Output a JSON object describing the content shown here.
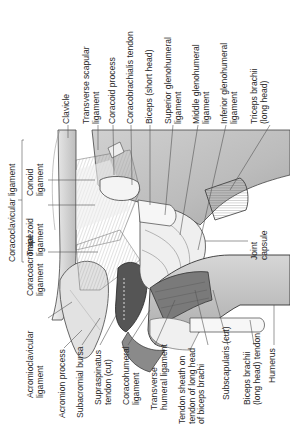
{
  "figure": {
    "orientation": "rotated 90° counter-clockwise"
  },
  "labels_top": [
    {
      "id": "clavicle",
      "lines": [
        "Clavicle"
      ]
    },
    {
      "id": "transverse-scapular-ligament",
      "lines": [
        "Transverse scapular",
        "ligament"
      ]
    },
    {
      "id": "coracoid-process",
      "lines": [
        "Coracoid process"
      ]
    },
    {
      "id": "coracobrachialis-tendon",
      "lines": [
        "Coracobrachialis tendon"
      ]
    },
    {
      "id": "biceps-short-head",
      "lines": [
        "Biceps (short head)"
      ]
    },
    {
      "id": "superior-glenohumeral-ligament",
      "lines": [
        "Superior glenohumeral",
        "ligament"
      ]
    },
    {
      "id": "middle-glenohumeral-ligament",
      "lines": [
        "Middle glenohumeral",
        "ligament"
      ]
    },
    {
      "id": "inferior-glenohumeral-ligament",
      "lines": [
        "Inferior glenohumeral",
        "ligament"
      ]
    },
    {
      "id": "triceps-brachii-long-head",
      "lines": [
        "Triceps brachii",
        "(long head)"
      ]
    }
  ],
  "labels_left": [
    {
      "id": "coracoclavicular-ligament",
      "lines": [
        "Coracoclavicular ligament"
      ]
    },
    {
      "id": "conoid-ligament",
      "lines": [
        "Conoid",
        "ligament"
      ]
    },
    {
      "id": "trapezoid-ligament",
      "lines": [
        "Trapezoid",
        "ligament"
      ]
    },
    {
      "id": "coracoacromial-ligament",
      "lines": [
        "Coracoacromial",
        "ligament"
      ]
    }
  ],
  "labels_right": [
    {
      "id": "joint-capsule",
      "lines": [
        "Joint",
        "capsule"
      ]
    }
  ],
  "labels_bottom": [
    {
      "id": "acromioclavicular-ligament",
      "lines": [
        "Acromioclavicular",
        "ligament"
      ]
    },
    {
      "id": "acromion-process",
      "lines": [
        "Acromion process"
      ]
    },
    {
      "id": "subacromial-bursa",
      "lines": [
        "Subacromial bursa"
      ]
    },
    {
      "id": "supraspinatus-tendon-cut",
      "lines": [
        "Supraspinatus",
        "tendon (cut)"
      ]
    },
    {
      "id": "coracohumeral-ligament",
      "lines": [
        "Coracohumeral",
        "ligament"
      ]
    },
    {
      "id": "transverse-humeral-ligament",
      "lines": [
        "Transverse",
        "humeral ligament"
      ]
    },
    {
      "id": "tendon-sheath-biceps",
      "lines": [
        "Tendon sheath on",
        "tendon of long head",
        "of biceps brachi"
      ]
    },
    {
      "id": "subscapularis-cut",
      "lines": [
        "Subscapularis (cut)"
      ]
    },
    {
      "id": "biceps-long-head-tendon",
      "lines": [
        "Biceps brachii",
        "(long head) tendon"
      ]
    },
    {
      "id": "humerus",
      "lines": [
        "Humerus"
      ]
    }
  ],
  "colors": {
    "bone_light": "#e6e6e6",
    "bone_mid": "#c9c9c9",
    "bone_dark": "#9a9a9a",
    "muscle_dark": "#6e6e6e",
    "outline": "#3a3a3a",
    "leader": "#555555"
  }
}
